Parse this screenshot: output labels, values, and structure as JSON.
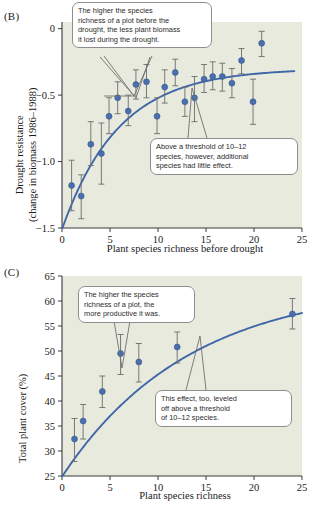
{
  "figure": {
    "panels": [
      {
        "label": "(B)"
      },
      {
        "label": "(C)"
      }
    ]
  },
  "colors": {
    "point": "#4a6fae",
    "curve": "#3f67a8",
    "errorbar": "#6b6b6b",
    "plot_background": "#e9eade",
    "axis": "#3a3a3a",
    "callout_border": "#8e8e8e"
  },
  "panel_b": {
    "label": "(B)",
    "callouts": [
      {
        "name": "callout-richness-biomass",
        "lines": [
          "The higher the species",
          "richness of a plot before the",
          "drought, the less plant biomass",
          "it lost during the drought."
        ]
      },
      {
        "name": "callout-threshold",
        "lines": [
          "Above a threshold of 10–12",
          "species, however, additional",
          "species had little effect."
        ]
      }
    ]
  },
  "panel_c": {
    "label": "(C)",
    "callouts": [
      {
        "name": "callout-productivity",
        "lines": [
          "The higher the species",
          "richness of a plot, the",
          "more productive it was."
        ]
      },
      {
        "name": "callout-leveled-off",
        "lines": [
          "This effect, too, leveled",
          "off above a threshold",
          "of 10–12 species."
        ]
      }
    ]
  },
  "chart_data": [
    {
      "id": "panel-b",
      "type": "scatter",
      "title": "(B)",
      "xlabel": "Plant species richness before drought",
      "ylabel": "Drought resistance (change in biomass 1986–1988)",
      "ylabel_line1": "Drought resistance",
      "ylabel_line2": "(change in biomass 1986–1988)",
      "xlim": [
        0,
        25
      ],
      "ylim": [
        -1.5,
        0.05
      ],
      "xticks": [
        0,
        5,
        10,
        15,
        20,
        25
      ],
      "yticks": [
        0,
        -0.5,
        -1.0,
        -1.5
      ],
      "ytick_labels": [
        "0",
        "−0.5",
        "−1.0",
        "−1.5"
      ],
      "grid": false,
      "legend": "none",
      "points": [
        {
          "x": 1.0,
          "y": -1.18,
          "yerr_low": -1.37,
          "yerr_high": -0.99
        },
        {
          "x": 2.0,
          "y": -1.26,
          "yerr_low": -1.43,
          "yerr_high": -1.1
        },
        {
          "x": 3.0,
          "y": -0.87,
          "yerr_low": -1.03,
          "yerr_high": -0.7
        },
        {
          "x": 4.1,
          "y": -0.94,
          "yerr_low": -1.17,
          "yerr_high": -0.71
        },
        {
          "x": 4.9,
          "y": -0.66,
          "yerr_low": -0.79,
          "yerr_high": -0.52
        },
        {
          "x": 5.8,
          "y": -0.52,
          "yerr_low": -0.64,
          "yerr_high": -0.4
        },
        {
          "x": 6.9,
          "y": -0.62,
          "yerr_low": -0.73,
          "yerr_high": -0.5
        },
        {
          "x": 7.7,
          "y": -0.42,
          "yerr_low": -0.53,
          "yerr_high": -0.31
        },
        {
          "x": 8.8,
          "y": -0.4,
          "yerr_low": -0.52,
          "yerr_high": -0.27
        },
        {
          "x": 9.9,
          "y": -0.66,
          "yerr_low": -0.79,
          "yerr_high": -0.52
        },
        {
          "x": 10.7,
          "y": -0.44,
          "yerr_low": -0.56,
          "yerr_high": -0.31
        },
        {
          "x": 11.8,
          "y": -0.33,
          "yerr_low": -0.43,
          "yerr_high": -0.23
        },
        {
          "x": 12.8,
          "y": -0.55,
          "yerr_low": -0.66,
          "yerr_high": -0.44
        },
        {
          "x": 13.8,
          "y": -0.52,
          "yerr_low": -0.7,
          "yerr_high": -0.36
        },
        {
          "x": 14.8,
          "y": -0.38,
          "yerr_low": -0.48,
          "yerr_high": -0.27
        },
        {
          "x": 15.7,
          "y": -0.36,
          "yerr_low": -0.46,
          "yerr_high": -0.25
        },
        {
          "x": 16.7,
          "y": -0.36,
          "yerr_low": -0.47,
          "yerr_high": -0.26
        },
        {
          "x": 17.7,
          "y": -0.41,
          "yerr_low": -0.52,
          "yerr_high": -0.3
        },
        {
          "x": 18.7,
          "y": -0.24,
          "yerr_low": -0.34,
          "yerr_high": -0.15
        },
        {
          "x": 19.9,
          "y": -0.55,
          "yerr_low": -0.72,
          "yerr_high": -0.38
        },
        {
          "x": 20.8,
          "y": -0.11,
          "yerr_low": -0.21,
          "yerr_high": -0.02
        }
      ],
      "fit_curve": {
        "description": "saturating curve rising from -1.5 at x=0 toward about -0.32 at x=24",
        "asymptote": -0.3,
        "x_start": 0.05,
        "x_end": 24.2,
        "y_start": -1.5,
        "y_end": -0.32
      }
    },
    {
      "id": "panel-c",
      "type": "scatter",
      "title": "(C)",
      "xlabel": "Plant species richness",
      "ylabel": "Total plant cover (%)",
      "xlim": [
        0,
        25
      ],
      "ylim": [
        25,
        65
      ],
      "xticks": [
        0,
        5,
        10,
        15,
        20,
        25
      ],
      "yticks": [
        25,
        30,
        35,
        40,
        45,
        50,
        55,
        60,
        65
      ],
      "grid": false,
      "legend": "none",
      "points": [
        {
          "x": 1.3,
          "y": 32.4,
          "yerr_low": 27.9,
          "yerr_high": 36.5
        },
        {
          "x": 2.2,
          "y": 36.0,
          "yerr_low": 32.4,
          "yerr_high": 39.3
        },
        {
          "x": 4.2,
          "y": 41.9,
          "yerr_low": 38.7,
          "yerr_high": 45.0
        },
        {
          "x": 6.1,
          "y": 49.5,
          "yerr_low": 45.3,
          "yerr_high": 53.3
        },
        {
          "x": 8.0,
          "y": 47.8,
          "yerr_low": 43.8,
          "yerr_high": 51.5
        },
        {
          "x": 12.0,
          "y": 50.8,
          "yerr_low": 47.6,
          "yerr_high": 53.8
        },
        {
          "x": 24.0,
          "y": 57.4,
          "yerr_low": 54.4,
          "yerr_high": 60.5
        }
      ],
      "fit_curve": {
        "description": "saturating logarithmic curve from 25 at x=0 to about 57.5 at x=25",
        "x_start": 0.05,
        "x_end": 25,
        "y_start": 25,
        "y_end": 57.6
      }
    }
  ]
}
